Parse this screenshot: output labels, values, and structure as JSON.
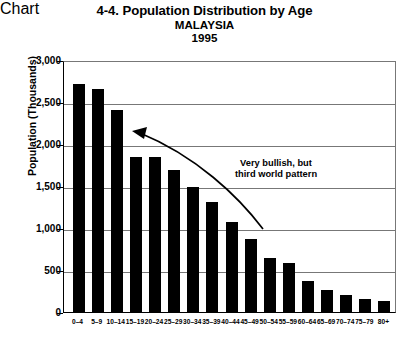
{
  "chart_data": {
    "type": "bar",
    "title": "4-4. Population Distribution by Age",
    "subtitle": "MALAYSIA",
    "year": "1995",
    "xlabel": "",
    "ylabel": "Population (Thousands)",
    "ylim": [
      0,
      3000
    ],
    "ytick_labels": [
      "3,000",
      "2,500",
      "2,000",
      "1,500",
      "1,000",
      "500",
      "0"
    ],
    "ytick_values": [
      3000,
      2500,
      2000,
      1500,
      1000,
      500,
      0
    ],
    "grid": true,
    "legend": "none",
    "categories": [
      "0-4",
      "5-9",
      "10-14",
      "15-19",
      "20-24",
      "25-29",
      "30-34",
      "35-39",
      "40-44",
      "45-49",
      "50-54",
      "55-59",
      "60-64",
      "65-69",
      "70-74",
      "75-79",
      "80+"
    ],
    "values": [
      2720,
      2660,
      2400,
      1850,
      1850,
      1690,
      1490,
      1310,
      1070,
      870,
      640,
      580,
      370,
      260,
      200,
      160,
      130
    ],
    "annotations": [
      {
        "name": "very-bullish-note",
        "line1": "Very bullish, but",
        "line2": "third world pattern",
        "arrow": "curved arrow pointing left toward the tall young-age bars"
      }
    ],
    "colors": {
      "bar": "#000000",
      "grid": "#777777",
      "axis": "#000000",
      "background": "#ffffff",
      "text": "#000000"
    }
  }
}
